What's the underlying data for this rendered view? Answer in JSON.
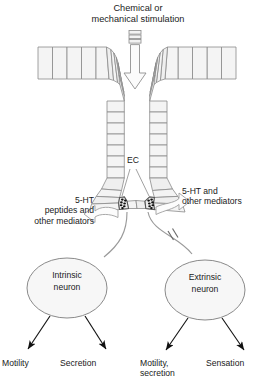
{
  "diagram": {
    "title": "Chemical or\nmechanical stimulation",
    "stimulus_arrow": {
      "name": "downward-stimulation-arrow",
      "segments": 3,
      "direction": "down"
    },
    "epithelium": {
      "label": "intestinal crypt wall",
      "left_horizontal_cells": 4,
      "right_horizontal_cells": 4,
      "left_radial_cells": 8,
      "right_radial_cells": 8,
      "left_vertical_cells": 7,
      "right_vertical_cells": 7,
      "base_cells": 7
    },
    "ec_cells": {
      "label": "EC",
      "count": 2,
      "granules_per_cell": 7
    },
    "mediator_arrows": {
      "left": "5-HT\npeptides and\nother mediators",
      "right": "5-HT and\nother mediators"
    },
    "neurons": [
      {
        "id": "intrinsic",
        "label": "Intrinsic\nneuron"
      },
      {
        "id": "extrinsic",
        "label": "Extrinsic\nneuron"
      }
    ],
    "synapse_mark": {
      "name": "synapse-break-mark",
      "on": "extrinsic-connector"
    },
    "outputs": [
      {
        "id": "motility",
        "label": "Motility",
        "from": "intrinsic"
      },
      {
        "id": "secretion",
        "label": "Secretion",
        "from": "intrinsic"
      },
      {
        "id": "motility-secretion",
        "label": "Motility,\nsecretion",
        "from": "extrinsic"
      },
      {
        "id": "sensation",
        "label": "Sensation",
        "from": "extrinsic"
      }
    ],
    "colors": {
      "stroke": "#8a8a8a",
      "dark_stroke": "#1a1a1a",
      "cell_fill": "#f4f4f4",
      "granule": "#111111",
      "neuron_fill": "#f7f7f7",
      "background": "#ffffff"
    }
  }
}
